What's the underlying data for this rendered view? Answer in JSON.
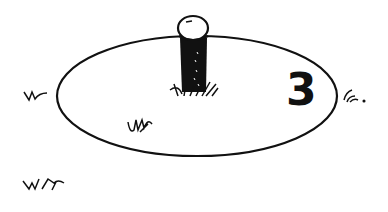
{
  "illustration": {
    "subject": "tee post in an oval area with grass tufts",
    "number_label": "3",
    "colors": {
      "ink": "#111111",
      "background": "#ffffff"
    }
  }
}
